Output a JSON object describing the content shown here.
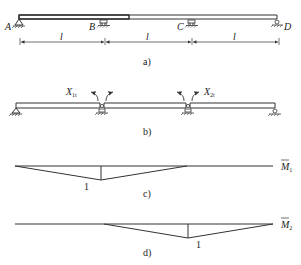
{
  "figure_a": {
    "caption": "a)",
    "supports": [
      "A",
      "B",
      "C",
      "D"
    ],
    "spans": [
      "l",
      "l",
      "l"
    ]
  },
  "figure_b": {
    "caption": "b)",
    "unknowns": [
      {
        "symbol": "X",
        "subscript": "1t"
      },
      {
        "symbol": "X",
        "subscript": "2t"
      }
    ]
  },
  "figure_c": {
    "caption": "c)",
    "moment_label": "M",
    "moment_subscript": "1",
    "peak_value": "1"
  },
  "figure_d": {
    "caption": "d)",
    "moment_label": "M",
    "moment_subscript": "2",
    "peak_value": "1"
  }
}
